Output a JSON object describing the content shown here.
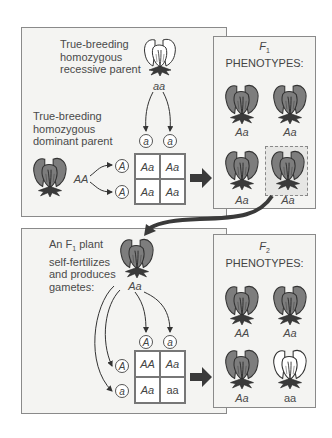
{
  "cross1": {
    "recessive_parent_label": [
      "True-breeding",
      "homozygous",
      "recessive parent"
    ],
    "recessive_parent_genotype": "aa",
    "dominant_parent_label": [
      "True-breeding",
      "homozygous",
      "dominant parent"
    ],
    "dominant_parent_genotype": "AA",
    "punnett": {
      "column_gametes": [
        "a",
        "a"
      ],
      "row_gametes": [
        "A",
        "A"
      ],
      "cells": [
        [
          "Aa",
          "Aa"
        ],
        [
          "Aa",
          "Aa"
        ]
      ]
    }
  },
  "f1_panel": {
    "title_gen": "F",
    "title_sub": "1",
    "title_rest": "PHENOTYPES:",
    "plants": [
      {
        "genotype": "Aa",
        "color": "purple"
      },
      {
        "genotype": "Aa",
        "color": "purple"
      },
      {
        "genotype": "Aa",
        "color": "purple"
      },
      {
        "genotype": "Aa",
        "color": "purple",
        "highlighted": true
      }
    ]
  },
  "cross2": {
    "label": [
      "An F",
      "1",
      " plant",
      "self-fertilizes",
      "and produces",
      "gametes:"
    ],
    "parent_genotype": "Aa",
    "punnett": {
      "column_gametes": [
        "A",
        "a"
      ],
      "row_gametes": [
        "A",
        "a"
      ],
      "cells": [
        [
          "AA",
          "Aa"
        ],
        [
          "Aa",
          "aa"
        ]
      ]
    }
  },
  "f2_panel": {
    "title_gen": "F",
    "title_sub": "2",
    "title_rest": "PHENOTYPES:",
    "plants": [
      {
        "genotype": "AA",
        "color": "purple"
      },
      {
        "genotype": "Aa",
        "color": "purple"
      },
      {
        "genotype": "Aa",
        "color": "purple"
      },
      {
        "genotype": "aa",
        "color": "white"
      }
    ]
  },
  "colors": {
    "purple_flower": "#7d7d7d",
    "white_flower": "#ffffff",
    "panel_bg": "#f4f4f2",
    "arrow": "#3a3a3a"
  }
}
